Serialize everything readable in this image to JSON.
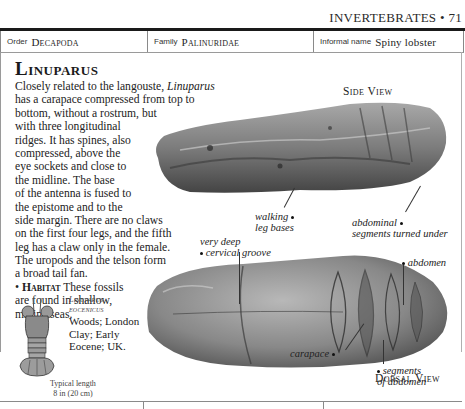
{
  "running_head": {
    "section": "INVERTEBRATES",
    "separator": "•",
    "page_number": "71"
  },
  "info_bar": {
    "order": {
      "label": "Order",
      "value": "Decapoda"
    },
    "family": {
      "label": "Family",
      "value": "Palinuridae"
    },
    "informal_name": {
      "label": "Informal name",
      "value": "Spiny lobster"
    }
  },
  "entry": {
    "title": "Linuparus",
    "description_lines": [
      [
        "Closely related to the langouste, ",
        "Linuparus",
        ""
      ],
      [
        "has a carapace compressed from top to"
      ],
      [
        "bottom, without a rostrum, but"
      ],
      [
        "with three longitudinal"
      ],
      [
        "ridges. It has spines, also"
      ],
      [
        "compressed, above the"
      ],
      [
        "eye sockets and close to"
      ],
      [
        "the midline. The base"
      ],
      [
        "of the antenna is fused to"
      ],
      [
        "the epistome and to the"
      ],
      [
        "side margin. There are no claws"
      ],
      [
        "on the first four legs, and the fifth"
      ],
      [
        "leg has a claw only in the female."
      ],
      [
        "The uropods and the telson form"
      ],
      [
        "a broad tail fan."
      ]
    ],
    "habitat": {
      "bullet": "•",
      "label": "Habitat",
      "lines": [
        "These fossils",
        "are found in shallow,",
        "marine seas."
      ]
    }
  },
  "specimen": {
    "name_lines": [
      "Linuparus",
      "eocenicus"
    ],
    "info_lines": [
      "Woods; London",
      "Clay; Early",
      "Eocene; UK."
    ],
    "typical_length_lines": [
      "Typical length",
      "8 in (20 cm)"
    ],
    "icon": "lobster-illustration"
  },
  "views": {
    "side": {
      "label": "Side View",
      "annotations": {
        "walking_leg_bases": [
          "walking",
          "leg bases"
        ],
        "abdominal_segments": [
          "abdominal",
          "segments turned under"
        ]
      }
    },
    "dorsal": {
      "label": "Dorsal View",
      "annotations": {
        "cervical_groove": [
          "very deep",
          "cervical groove"
        ],
        "abdomen": [
          "abdomen"
        ],
        "carapace": [
          "carapace"
        ],
        "segments_of_abdomen": [
          "segments",
          "of abdomen"
        ]
      }
    }
  },
  "colors": {
    "text": "#1e1e1e",
    "rule": "#1a1a1a",
    "fossil_light": "#b5b5b5",
    "fossil_dark": "#4a4a4a"
  }
}
